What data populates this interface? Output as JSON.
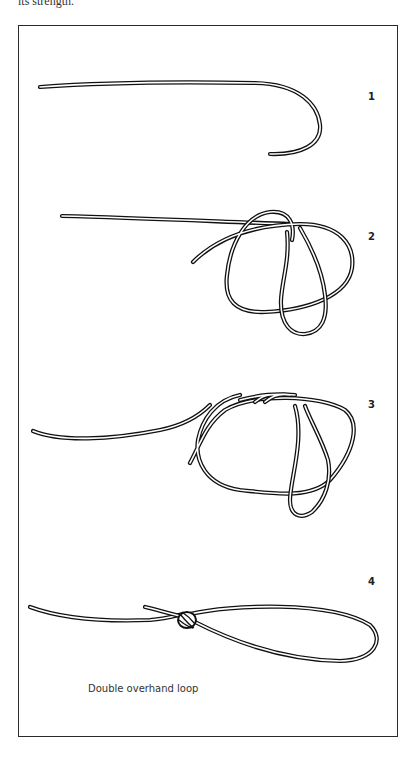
{
  "page": {
    "top_text_fragment": "its strength."
  },
  "figure": {
    "caption": "Double overhand loop",
    "steps": [
      {
        "number": "1",
        "description": "straight rope with hooked end"
      },
      {
        "number": "2",
        "description": "rope formed into loop with bight"
      },
      {
        "number": "3",
        "description": "double wrap around loop"
      },
      {
        "number": "4",
        "description": "finished double overhand loop"
      }
    ]
  },
  "colors": {
    "ink": "#111111",
    "frame": "#2a2a2a",
    "background": "#ffffff"
  }
}
